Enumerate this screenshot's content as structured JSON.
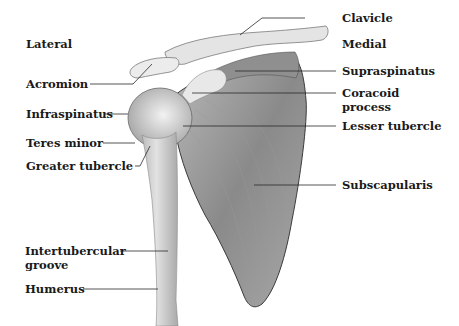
{
  "diagram": {
    "orientation": {
      "left": "Lateral",
      "right": "Medial"
    },
    "labels_left": [
      {
        "id": "acromion",
        "text": "Acromion"
      },
      {
        "id": "infraspinatus",
        "text": "Infraspinatus"
      },
      {
        "id": "teres-minor",
        "text": "Teres minor"
      },
      {
        "id": "greater-tubercle",
        "text": "Greater tubercle"
      },
      {
        "id": "intertubercular-groove",
        "text": "Intertubercular groove",
        "line1": "Intertubercular",
        "line2": "groove"
      },
      {
        "id": "humerus",
        "text": "Humerus"
      }
    ],
    "labels_right": [
      {
        "id": "clavicle",
        "text": "Clavicle"
      },
      {
        "id": "supraspinatus",
        "text": "Supraspinatus"
      },
      {
        "id": "coracoid-process",
        "text": "Coracoid process",
        "line1": "Coracoid",
        "line2": "process"
      },
      {
        "id": "lesser-tubercle",
        "text": "Lesser tubercle"
      },
      {
        "id": "subscapularis",
        "text": "Subscapularis"
      }
    ],
    "colors": {
      "label": "#1a1a1a",
      "leader": "#2a2a2a",
      "muscle_dark": "#6e6e6e",
      "bone_light": "#e6e6e6"
    }
  }
}
